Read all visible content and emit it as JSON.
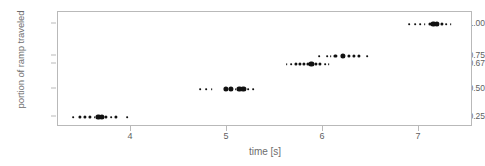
{
  "chart_data": {
    "type": "scatter",
    "title": "",
    "xlabel": "time [s]",
    "ylabel": "portion of ramp traveled",
    "xlim": [
      3.25,
      7.56
    ],
    "ylim": [
      0,
      6
    ],
    "grid": false,
    "legend": null,
    "xticks": [
      {
        "label": "4",
        "value": 4
      },
      {
        "label": "5",
        "value": 5
      },
      {
        "label": "6",
        "value": 6
      },
      {
        "label": "7",
        "value": 7
      }
    ],
    "yticks": [
      {
        "label": "1.00",
        "value": 1.0
      },
      {
        "label": "0.75",
        "value": 0.75
      },
      {
        "label": "0.67",
        "value": 0.67
      },
      {
        "label": "0.50",
        "value": 0.5
      },
      {
        "label": "0.25",
        "value": 0.25
      }
    ],
    "note": "Strip/dot plot: marker size encodes the number of coincident repeated measurements at that time value.",
    "series": [
      {
        "name": "0.25",
        "category": "0.25",
        "y": 0.25,
        "points": [
          {
            "x": 3.4,
            "count": 1
          },
          {
            "x": 3.47,
            "count": 2
          },
          {
            "x": 3.52,
            "count": 2
          },
          {
            "x": 3.57,
            "count": 2
          },
          {
            "x": 3.62,
            "count": 1
          },
          {
            "x": 3.66,
            "count": 3
          },
          {
            "x": 3.7,
            "count": 3
          },
          {
            "x": 3.74,
            "count": 2
          },
          {
            "x": 3.79,
            "count": 1
          },
          {
            "x": 3.84,
            "count": 2
          },
          {
            "x": 3.96,
            "count": 1
          }
        ]
      },
      {
        "name": "0.50",
        "category": "0.50",
        "y": 0.5,
        "points": [
          {
            "x": 4.72,
            "count": 1
          },
          {
            "x": 4.78,
            "count": 1
          },
          {
            "x": 4.84,
            "count": 1
          },
          {
            "x": 4.99,
            "count": 3
          },
          {
            "x": 5.04,
            "count": 3
          },
          {
            "x": 5.09,
            "count": 1
          },
          {
            "x": 5.13,
            "count": 3
          },
          {
            "x": 5.17,
            "count": 3
          },
          {
            "x": 5.22,
            "count": 1
          },
          {
            "x": 5.27,
            "count": 1
          }
        ]
      },
      {
        "name": "0.67",
        "category": "0.67",
        "y": 0.67,
        "points": [
          {
            "x": 5.62,
            "count": 1
          },
          {
            "x": 5.67,
            "count": 1
          },
          {
            "x": 5.72,
            "count": 2
          },
          {
            "x": 5.76,
            "count": 2
          },
          {
            "x": 5.8,
            "count": 2
          },
          {
            "x": 5.84,
            "count": 2
          },
          {
            "x": 5.88,
            "count": 3
          },
          {
            "x": 5.93,
            "count": 2
          },
          {
            "x": 5.97,
            "count": 2
          },
          {
            "x": 6.02,
            "count": 1
          },
          {
            "x": 6.06,
            "count": 1
          }
        ]
      },
      {
        "name": "0.75",
        "category": "0.75",
        "y": 0.75,
        "points": [
          {
            "x": 5.96,
            "count": 1
          },
          {
            "x": 6.04,
            "count": 1
          },
          {
            "x": 6.08,
            "count": 1
          },
          {
            "x": 6.13,
            "count": 2
          },
          {
            "x": 6.21,
            "count": 3
          },
          {
            "x": 6.27,
            "count": 2
          },
          {
            "x": 6.32,
            "count": 2
          },
          {
            "x": 6.37,
            "count": 2
          },
          {
            "x": 6.46,
            "count": 1
          }
        ]
      },
      {
        "name": "1.00",
        "category": "1.00",
        "y": 1.0,
        "points": [
          {
            "x": 6.9,
            "count": 1
          },
          {
            "x": 6.96,
            "count": 1
          },
          {
            "x": 7.01,
            "count": 1
          },
          {
            "x": 7.06,
            "count": 1
          },
          {
            "x": 7.11,
            "count": 2
          },
          {
            "x": 7.15,
            "count": 3
          },
          {
            "x": 7.19,
            "count": 3
          },
          {
            "x": 7.24,
            "count": 2
          },
          {
            "x": 7.28,
            "count": 1
          },
          {
            "x": 7.33,
            "count": 1
          }
        ]
      }
    ]
  }
}
